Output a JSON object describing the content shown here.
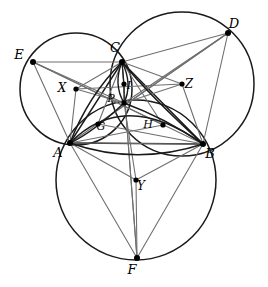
{
  "figure": {
    "width": 268,
    "height": 287,
    "background_color": "#ffffff",
    "stroke_dark": "#1a1a1a",
    "stroke_light": "#6f6f6f",
    "point_color": "#000000"
  },
  "points": {
    "A": {
      "label": "A",
      "x": 70,
      "y": 143,
      "label_x": 58,
      "label_y": 157,
      "kind": "vertex"
    },
    "B": {
      "label": "B",
      "x": 203,
      "y": 144,
      "label_x": 210,
      "label_y": 158,
      "kind": "vertex"
    },
    "C": {
      "label": "C",
      "x": 122,
      "y": 62,
      "label_x": 115,
      "label_y": 52,
      "kind": "vertex"
    },
    "D": {
      "label": "D",
      "x": 228,
      "y": 33,
      "label_x": 234,
      "label_y": 28,
      "kind": "vertex"
    },
    "E": {
      "label": "E",
      "x": 33,
      "y": 62,
      "label_x": 19,
      "label_y": 59,
      "kind": "vertex"
    },
    "F": {
      "label": "F",
      "x": 137,
      "y": 258,
      "label_x": 132,
      "label_y": 274,
      "kind": "vertex"
    },
    "X": {
      "label": "X",
      "x": 76,
      "y": 89,
      "label_x": 62,
      "label_y": 92,
      "kind": "center"
    },
    "Y": {
      "label": "Y",
      "x": 136,
      "y": 180,
      "label_x": 141,
      "label_y": 190,
      "kind": "center"
    },
    "Z": {
      "label": "Z",
      "x": 182,
      "y": 84,
      "label_x": 189,
      "label_y": 88,
      "kind": "center"
    },
    "G": {
      "label": "G",
      "x": 98,
      "y": 124,
      "label_x": 101,
      "label_y": 130,
      "kind": "inner"
    },
    "H": {
      "label": "H",
      "x": 163,
      "y": 125,
      "label_x": 148,
      "label_y": 128,
      "kind": "inner"
    },
    "I": {
      "label": "I",
      "x": 124,
      "y": 84,
      "label_x": 129,
      "label_y": 89,
      "kind": "inner"
    },
    "P": {
      "label": "P",
      "x": 124,
      "y": 103,
      "label_x": 111,
      "label_y": 102,
      "kind": "inner"
    }
  },
  "circles": [
    {
      "name": "circle-X-AEC",
      "center": "X",
      "cx": 76,
      "cy": 89,
      "r": 56,
      "through": [
        "A",
        "E",
        "C"
      ],
      "stroke": "#1a1a1a",
      "width": 1.5
    },
    {
      "name": "circle-Y-ABF",
      "center": "Y",
      "cx": 136,
      "cy": 180,
      "r": 80,
      "through": [
        "A",
        "B",
        "F"
      ],
      "stroke": "#1a1a1a",
      "width": 1.5
    },
    {
      "name": "circle-Z-CDB",
      "center": "Z",
      "cx": 182,
      "cy": 84,
      "r": 72,
      "through": [
        "C",
        "D",
        "B"
      ],
      "stroke": "#1a1a1a",
      "width": 1.5
    }
  ],
  "arcs": [
    {
      "name": "arc-inner-left-A-P-C",
      "d": "M 70 143 Q 88 96 122 62",
      "stroke": "#1a1a1a",
      "width": 1.6
    },
    {
      "name": "arc-inner-right-C-P-B",
      "d": "M 122 62 Q 150 96 203 144",
      "stroke": "#1a1a1a",
      "width": 1.6
    },
    {
      "name": "arc-inner-bottom-A-P-B",
      "d": "M 70 143 Q 124 88 203 144",
      "stroke": "#1a1a1a",
      "width": 1.6
    },
    {
      "name": "arc-lens-left-upper",
      "d": "M 122 62 Q 113 84 124 103",
      "stroke": "#1a1a1a",
      "width": 1.4
    },
    {
      "name": "arc-lens-right-upper",
      "d": "M 122 62 Q 133 84 124 103",
      "stroke": "#1a1a1a",
      "width": 1.4
    },
    {
      "name": "arc-A-G-P",
      "d": "M 70 143 Q 92 133 124 103",
      "stroke": "#1a1a1a",
      "width": 1.4
    },
    {
      "name": "arc-P-H-B",
      "d": "M 124 103 Q 165 118 203 144",
      "stroke": "#1a1a1a",
      "width": 1.4
    },
    {
      "name": "arc-A-lower-B",
      "d": "M 70 143 Q 136 166 203 144",
      "stroke": "#1a1a1a",
      "width": 1.4
    }
  ],
  "segments": [
    {
      "name": "segment-A-B",
      "from": "A",
      "to": "B",
      "stroke": "#1a1a1a",
      "width": 1.4
    },
    {
      "name": "segment-A-C",
      "from": "A",
      "to": "C",
      "stroke": "#1a1a1a",
      "width": 1.4
    },
    {
      "name": "segment-C-B",
      "from": "C",
      "to": "B",
      "stroke": "#1a1a1a",
      "width": 1.4
    },
    {
      "name": "segment-E-C",
      "from": "E",
      "to": "C",
      "stroke": "#6f6f6f",
      "width": 1.1
    },
    {
      "name": "segment-E-A",
      "from": "E",
      "to": "A",
      "stroke": "#6f6f6f",
      "width": 1.1
    },
    {
      "name": "segment-E-B",
      "from": "E",
      "to": "B",
      "stroke": "#6f6f6f",
      "width": 1.1
    },
    {
      "name": "segment-E-P",
      "from": "E",
      "to": "P",
      "stroke": "#6f6f6f",
      "width": 1.1
    },
    {
      "name": "segment-E-H",
      "from": "E",
      "to": "H",
      "stroke": "#6f6f6f",
      "width": 1.1
    },
    {
      "name": "segment-D-C",
      "from": "D",
      "to": "C",
      "stroke": "#6f6f6f",
      "width": 1.1
    },
    {
      "name": "segment-D-B",
      "from": "D",
      "to": "B",
      "stroke": "#6f6f6f",
      "width": 1.1
    },
    {
      "name": "segment-D-A",
      "from": "D",
      "to": "A",
      "stroke": "#6f6f6f",
      "width": 1.1
    },
    {
      "name": "segment-D-P",
      "from": "D",
      "to": "P",
      "stroke": "#6f6f6f",
      "width": 1.1
    },
    {
      "name": "segment-D-G",
      "from": "D",
      "to": "G",
      "stroke": "#6f6f6f",
      "width": 1.1
    },
    {
      "name": "segment-F-A",
      "from": "F",
      "to": "A",
      "stroke": "#6f6f6f",
      "width": 1.1
    },
    {
      "name": "segment-F-B",
      "from": "F",
      "to": "B",
      "stroke": "#6f6f6f",
      "width": 1.1
    },
    {
      "name": "segment-F-C",
      "from": "F",
      "to": "C",
      "stroke": "#6f6f6f",
      "width": 1.1
    },
    {
      "name": "segment-F-Y",
      "from": "F",
      "to": "Y",
      "stroke": "#6f6f6f",
      "width": 1.1
    },
    {
      "name": "segment-X-Z",
      "from": "X",
      "to": "Z",
      "stroke": "#6f6f6f",
      "width": 1.1
    },
    {
      "name": "segment-X-P",
      "from": "X",
      "to": "P",
      "stroke": "#6f6f6f",
      "width": 1.1
    },
    {
      "name": "segment-X-C",
      "from": "X",
      "to": "C",
      "stroke": "#6f6f6f",
      "width": 1.1
    },
    {
      "name": "segment-X-A",
      "from": "X",
      "to": "A",
      "stroke": "#6f6f6f",
      "width": 1.1
    },
    {
      "name": "segment-Z-C",
      "from": "Z",
      "to": "C",
      "stroke": "#6f6f6f",
      "width": 1.1
    },
    {
      "name": "segment-Z-B",
      "from": "Z",
      "to": "B",
      "stroke": "#6f6f6f",
      "width": 1.1
    },
    {
      "name": "segment-Z-P",
      "from": "Z",
      "to": "P",
      "stroke": "#6f6f6f",
      "width": 1.1
    },
    {
      "name": "segment-Y-A",
      "from": "Y",
      "to": "A",
      "stroke": "#6f6f6f",
      "width": 1.1
    },
    {
      "name": "segment-Y-B",
      "from": "Y",
      "to": "B",
      "stroke": "#6f6f6f",
      "width": 1.1
    },
    {
      "name": "segment-Y-P",
      "from": "Y",
      "to": "P",
      "stroke": "#6f6f6f",
      "width": 1.1
    },
    {
      "name": "segment-C-P-F",
      "from": "C",
      "to": "F",
      "stroke": "#6f6f6f",
      "width": 1.1
    },
    {
      "name": "segment-A-P-H-B",
      "from": "A",
      "to": "B",
      "stroke": "#6f6f6f",
      "width": 0.9
    },
    {
      "name": "segment-C-H",
      "from": "C",
      "to": "H",
      "stroke": "#6f6f6f",
      "width": 1.1
    },
    {
      "name": "segment-C-G",
      "from": "C",
      "to": "G",
      "stroke": "#6f6f6f",
      "width": 1.1
    },
    {
      "name": "segment-G-B",
      "from": "G",
      "to": "B",
      "stroke": "#6f6f6f",
      "width": 1.1
    },
    {
      "name": "segment-A-H",
      "from": "A",
      "to": "H",
      "stroke": "#6f6f6f",
      "width": 1.1
    },
    {
      "name": "segment-P-I",
      "from": "P",
      "to": "I",
      "stroke": "#1a1a1a",
      "width": 1.2
    },
    {
      "name": "segment-I-C",
      "from": "I",
      "to": "C",
      "stroke": "#1a1a1a",
      "width": 1.2
    }
  ]
}
